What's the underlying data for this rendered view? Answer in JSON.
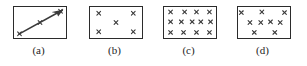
{
  "figure": {
    "title": "",
    "background_color": "#ffffff",
    "mark_color": "#3a3a3a",
    "border_color": "#2b2b2b",
    "panel_count": 4
  },
  "chart_data": {
    "type": "scatter",
    "title": "",
    "xlabel": "",
    "ylabel": "",
    "xlim": [
      0,
      100
    ],
    "ylim": [
      0,
      100
    ],
    "grid": false,
    "legend": "none",
    "panels": [
      {
        "label": "(a)",
        "caption": "(a)",
        "pattern": "linear-trend-with-arrow",
        "marker": "x",
        "arrow": {
          "from": [
            10,
            14
          ],
          "to": [
            92,
            88
          ],
          "arrowhead": "end",
          "color": "#3a3a3a"
        },
        "points": [
          [
            12,
            16
          ],
          [
            50,
            50
          ],
          [
            88,
            84
          ]
        ]
      },
      {
        "label": "(b)",
        "caption": "(b)",
        "pattern": "quincunx-sparse",
        "marker": "x",
        "points": [
          [
            18,
            78
          ],
          [
            82,
            78
          ],
          [
            50,
            50
          ],
          [
            18,
            22
          ],
          [
            82,
            22
          ]
        ]
      },
      {
        "label": "(c)",
        "caption": "(c)",
        "pattern": "dense-grid",
        "marker": "x",
        "points": [
          [
            14,
            82
          ],
          [
            40,
            82
          ],
          [
            62,
            82
          ],
          [
            86,
            82
          ],
          [
            14,
            52
          ],
          [
            34,
            52
          ],
          [
            54,
            52
          ],
          [
            70,
            52
          ],
          [
            88,
            52
          ],
          [
            14,
            20
          ],
          [
            38,
            20
          ],
          [
            62,
            20
          ],
          [
            86,
            20
          ]
        ]
      },
      {
        "label": "(d)",
        "caption": "(d)",
        "pattern": "random-scatter",
        "marker": "x",
        "points": [
          [
            8,
            80
          ],
          [
            46,
            82
          ],
          [
            88,
            80
          ],
          [
            24,
            50
          ],
          [
            44,
            50
          ],
          [
            62,
            52
          ],
          [
            80,
            50
          ],
          [
            32,
            20
          ],
          [
            70,
            20
          ]
        ]
      }
    ]
  }
}
